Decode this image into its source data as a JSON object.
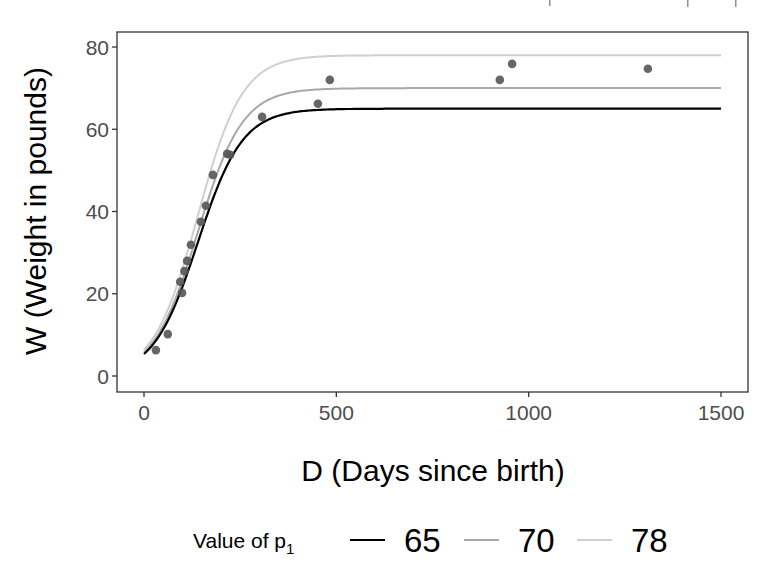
{
  "chart_data": {
    "type": "scatter",
    "title": "",
    "xlabel": "D (Days since birth)",
    "ylabel": "W (Weight in pounds)",
    "xlim": [
      -60,
      1560
    ],
    "ylim": [
      -4,
      84
    ],
    "x_ticks": [
      0,
      500,
      1000,
      1500
    ],
    "x_tick_labels": [
      "0",
      "500",
      "1000",
      "1500"
    ],
    "y_ticks": [
      0,
      20,
      40,
      60,
      80
    ],
    "y_tick_labels": [
      "0",
      "20",
      "40",
      "60",
      "80"
    ],
    "grid": false,
    "legend_position": "bottom",
    "legend": {
      "title": "Value of p",
      "title_subscript": "1",
      "entries": [
        {
          "label": "65",
          "color": "#000000"
        },
        {
          "label": "70",
          "color": "#a8a8a8"
        },
        {
          "label": "78",
          "color": "#cfcfcf"
        }
      ]
    },
    "points": {
      "color": "#555555",
      "x": [
        31,
        62,
        94,
        99,
        105,
        112,
        122,
        148,
        161,
        179,
        216,
        224,
        307,
        452,
        483,
        925,
        957,
        1310
      ],
      "y": [
        6.3,
        10.2,
        22.9,
        20.2,
        25.5,
        28.0,
        31.9,
        37.5,
        41.4,
        48.9,
        54.0,
        53.8,
        63.0,
        66.2,
        72.0,
        72.0,
        75.9,
        74.7
      ]
    },
    "series": [
      {
        "name": "65",
        "model": "logistic",
        "p1": 65,
        "p2": 140,
        "p3": 58,
        "x_range": [
          0,
          1500
        ],
        "color": "#000000",
        "width": 2.2
      },
      {
        "name": "70",
        "model": "logistic",
        "p1": 70,
        "p2": 140,
        "p3": 58,
        "x_range": [
          0,
          1500
        ],
        "color": "#a8a8a8",
        "width": 2.0
      },
      {
        "name": "78",
        "model": "logistic",
        "p1": 78,
        "p2": 140,
        "p3": 58,
        "x_range": [
          0,
          1500
        ],
        "color": "#cfcfcf",
        "width": 2.0
      }
    ]
  },
  "layout": {
    "panel": {
      "left": 117,
      "top": 32,
      "right": 748,
      "bottom": 392
    },
    "x_px": {
      "v0": 0,
      "p0": 144,
      "v1": 1500,
      "p1": 721
    },
    "y_px": {
      "v0": 0,
      "p0": 376,
      "v1": 80,
      "p1": 47
    }
  }
}
